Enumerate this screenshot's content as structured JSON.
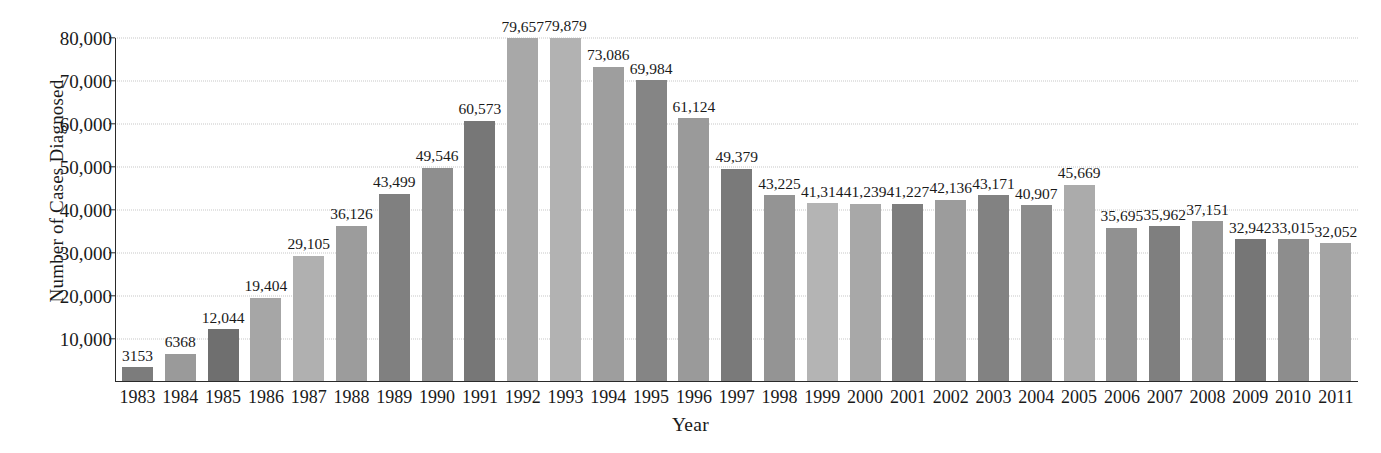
{
  "chart_data": {
    "type": "bar",
    "title": "",
    "xlabel": "Year",
    "ylabel": "Number of Cases Diagnosed",
    "ylim": [
      0,
      80000
    ],
    "ytick_labels": [
      "80,000",
      "70,000",
      "60,000",
      "50,000",
      "40,000",
      "30,000",
      "20,000",
      "10,000"
    ],
    "ytick_values": [
      80000,
      70000,
      60000,
      50000,
      40000,
      30000,
      20000,
      10000
    ],
    "grid": true,
    "legend": "none",
    "categories": [
      "1983",
      "1984",
      "1985",
      "1986",
      "1987",
      "1988",
      "1989",
      "1990",
      "1991",
      "1992",
      "1993",
      "1994",
      "1995",
      "1996",
      "1997",
      "1998",
      "1999",
      "2000",
      "2001",
      "2002",
      "2003",
      "2004",
      "2005",
      "2006",
      "2007",
      "2008",
      "2009",
      "2010",
      "2011"
    ],
    "values": [
      3153,
      6368,
      12044,
      19404,
      29105,
      36126,
      43499,
      49546,
      60573,
      79657,
      79879,
      73086,
      69984,
      61124,
      49379,
      43225,
      41314,
      41239,
      41227,
      42136,
      43171,
      40907,
      45669,
      35695,
      35962,
      37151,
      32942,
      33015,
      32052
    ],
    "value_labels": [
      "3153",
      "6368",
      "12,044",
      "19,404",
      "29,105",
      "36,126",
      "43,499",
      "49,546",
      "60,573",
      "79,657",
      "79,879",
      "73,086",
      "69,984",
      "61,124",
      "49,379",
      "43,225",
      "41,314",
      "41,239",
      "41,227",
      "42,136",
      "43,171",
      "40,907",
      "45,669",
      "35,695",
      "35,962",
      "37,151",
      "32,942",
      "33,015",
      "32,052"
    ],
    "bar_colors": [
      "#7c7c7c",
      "#9a9a9a",
      "#6f6f6f",
      "#a6a6a6",
      "#b0b0b0",
      "#9c9c9c",
      "#808080",
      "#8e8e8e",
      "#777777",
      "#a8a8a8",
      "#b2b2b2",
      "#9e9e9e",
      "#858585",
      "#9a9a9a",
      "#7a7a7a",
      "#949494",
      "#b4b4b4",
      "#a8a8a8",
      "#7e7e7e",
      "#9c9c9c",
      "#828282",
      "#8c8c8c",
      "#ababab",
      "#919191",
      "#7f7f7f",
      "#979797",
      "#767676",
      "#8d8d8d",
      "#a4a4a4"
    ],
    "axis_color": "#2a2a2a",
    "grid_color": "#c8c8c8",
    "background_color": "#ffffff"
  }
}
